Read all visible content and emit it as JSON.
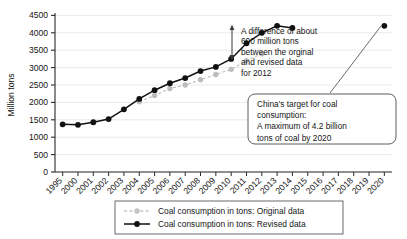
{
  "chart_data": {
    "type": "line",
    "title": "",
    "xlabel": "",
    "ylabel": "Million tons",
    "ylim": [
      0,
      4500
    ],
    "ytick_step": 500,
    "grid": true,
    "legend_position": "bottom",
    "categories": [
      "1995",
      "2000",
      "2001",
      "2002",
      "2003",
      "2004",
      "2005",
      "2006",
      "2007",
      "2008",
      "2009",
      "2010",
      "2011",
      "2012",
      "2013",
      "2014",
      "2015",
      "2016",
      "2017",
      "2018",
      "2019",
      "2020"
    ],
    "yticks": [
      "0",
      "500",
      "1000",
      "1500",
      "2000",
      "2500",
      "3000",
      "3500",
      "4000",
      "4500"
    ],
    "series": [
      {
        "name": "Coal consumption in tons: Original data",
        "color": "#bdbdbd",
        "style": "dashed",
        "marker": "circle",
        "x": [
          "2004",
          "2005",
          "2006",
          "2007",
          "2008",
          "2009",
          "2010",
          "2011",
          "2012"
        ],
        "values": [
          2020,
          2200,
          2400,
          2500,
          2650,
          2800,
          2950,
          3200,
          3400
        ]
      },
      {
        "name": "Coal consumption in tons: Revised data",
        "color": "#111111",
        "style": "solid",
        "marker": "circle",
        "x": [
          "1995",
          "2000",
          "2001",
          "2002",
          "2003",
          "2004",
          "2005",
          "2006",
          "2007",
          "2008",
          "2009",
          "2010",
          "2011",
          "2012",
          "2013",
          "2014"
        ],
        "values": [
          1370,
          1355,
          1430,
          1520,
          1800,
          2100,
          2350,
          2550,
          2700,
          2900,
          3020,
          3250,
          3700,
          4000,
          4200,
          4140
        ]
      },
      {
        "name": "China target point 2020",
        "color": "#111111",
        "style": "point",
        "marker": "circle",
        "x": [
          "2020"
        ],
        "values": [
          4200
        ]
      }
    ],
    "annotations": [
      {
        "id": "difference-note",
        "text_lines": [
          "A difference of about",
          "600 million tons",
          "between the orginal",
          "and revised data",
          "for 2012"
        ],
        "points_to_year": "2012",
        "arrow": "double-headed-vertical"
      },
      {
        "id": "china-target-callout",
        "text_lines": [
          "China's target for coal",
          "consumption:",
          "A maximum of 4.2 billion",
          "tons of coal by 2020"
        ],
        "points_to_year": "2020"
      }
    ]
  },
  "legend": {
    "items": [
      {
        "label": "Coal consumption in tons: Original data",
        "color": "#bdbdbd",
        "style": "dashed"
      },
      {
        "label": "Coal consumption in tons: Revised data",
        "color": "#111111",
        "style": "solid"
      }
    ]
  },
  "colors": {
    "original": "#bdbdbd",
    "revised": "#111111",
    "grid": "#e2e2e2",
    "axis": "#2a2a2a",
    "text": "#151515",
    "background": "#ffffff"
  }
}
